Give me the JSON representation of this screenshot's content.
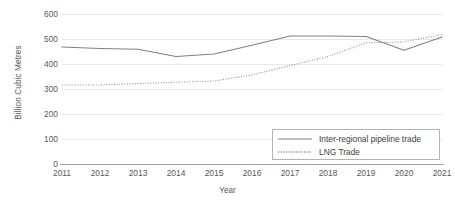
{
  "chart_data": {
    "type": "line",
    "title": "",
    "xlabel": "Year",
    "ylabel": "Billion Cubic Metres",
    "x": [
      2011,
      2012,
      2013,
      2014,
      2015,
      2016,
      2017,
      2018,
      2019,
      2020,
      2021
    ],
    "categories": [
      "2011",
      "2012",
      "2013",
      "2014",
      "2015",
      "2016",
      "2017",
      "2018",
      "2019",
      "2020",
      "2021"
    ],
    "xlim": [
      2011,
      2021
    ],
    "ylim": [
      0,
      600
    ],
    "yticks": [
      0,
      100,
      200,
      300,
      400,
      500,
      600
    ],
    "yticklabels": [
      "0",
      "100",
      "200",
      "300",
      "400",
      "500",
      "600"
    ],
    "grid": "horizontal",
    "legend_position": "lower-right-inside",
    "series": [
      {
        "name": "Inter-regional pipeline trade",
        "style": "solid",
        "color": "#808080",
        "values": [
          468,
          462,
          459,
          430,
          440,
          475,
          512,
          512,
          510,
          455,
          508
        ]
      },
      {
        "name": "LNG Trade",
        "style": "dotted",
        "color": "#909090",
        "values": [
          316,
          316,
          322,
          327,
          332,
          356,
          394,
          430,
          485,
          488,
          518
        ]
      }
    ]
  },
  "axes": {
    "y_title": "Billion Cubic Metres",
    "x_title": "Year",
    "y_tick_labels": [
      "600",
      "500",
      "400",
      "300",
      "200",
      "100",
      "0"
    ],
    "x_tick_labels": [
      "2011",
      "2012",
      "2013",
      "2014",
      "2015",
      "2016",
      "2017",
      "2018",
      "2019",
      "2020",
      "2021"
    ]
  },
  "legend": {
    "items": [
      {
        "label": "Inter-regional pipeline trade",
        "style": "solid"
      },
      {
        "label": "LNG Trade",
        "style": "dotted"
      }
    ]
  },
  "colors": {
    "series_solid": "#808080",
    "series_dotted": "#909090",
    "gridline": "#e8e8e8",
    "axis": "#a6a6a6",
    "tick_text": "#595959",
    "legend_border": "#b3b3b3",
    "legend_text": "#404040",
    "background": "#ffffff"
  }
}
